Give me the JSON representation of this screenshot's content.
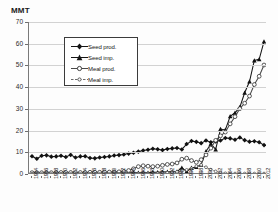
{
  "chart_data": {
    "type": "line",
    "title": "",
    "ylabel": "MMT",
    "xlabel": "",
    "ylim": [
      0,
      70
    ],
    "yticks": [
      0,
      10,
      20,
      30,
      40,
      50,
      60,
      70
    ],
    "grid": true,
    "legend_position": "upper-left-inside",
    "x": [
      1964,
      1965,
      1966,
      1967,
      1968,
      1969,
      1970,
      1971,
      1972,
      1973,
      1974,
      1975,
      1976,
      1977,
      1978,
      1979,
      1980,
      1981,
      1982,
      1983,
      1984,
      1985,
      1986,
      1987,
      1988,
      1989,
      1990,
      1991,
      1992,
      1993,
      1994,
      1995,
      1996,
      1997,
      1998,
      1999,
      2000,
      2001,
      2002,
      2003,
      2004,
      2005,
      2006,
      2007,
      2008,
      2009,
      2010,
      2011,
      2012
    ],
    "xtick_labels": [
      "1964",
      "1966",
      "1968",
      "1970",
      "1972",
      "1974",
      "1976",
      "1978",
      "1980",
      "1982",
      "1984",
      "1986",
      "1988",
      "1990",
      "1992",
      "1994",
      "1996",
      "1998",
      "2000",
      "2002",
      "2004",
      "2006",
      "2008",
      "2010",
      "2012"
    ],
    "series": [
      {
        "name": "Seed prod.",
        "marker": "filled-diamond",
        "line": "solid",
        "color": "#151515",
        "values": [
          8.2,
          7.0,
          8.4,
          8.6,
          8.0,
          8.1,
          8.4,
          7.8,
          8.8,
          7.6,
          8.1,
          8.2,
          7.4,
          7.2,
          7.6,
          7.8,
          8.1,
          8.5,
          8.7,
          9.0,
          9.4,
          9.8,
          10.3,
          10.8,
          11.2,
          11.6,
          11.4,
          11.0,
          11.5,
          11.8,
          12.0,
          11.3,
          13.8,
          15.2,
          14.8,
          14.2,
          15.4,
          14.6,
          15.0,
          15.4,
          16.6,
          16.4,
          15.8,
          16.8,
          15.6,
          14.9,
          15.1,
          14.6,
          13.3
        ]
      },
      {
        "name": "Seed imp.",
        "marker": "filled-triangle",
        "line": "solid",
        "color": "#151515",
        "values": [
          0.4,
          0.4,
          0.4,
          0.4,
          0.4,
          0.4,
          0.4,
          0.4,
          0.5,
          0.5,
          0.5,
          0.5,
          0.5,
          0.5,
          0.5,
          0.5,
          0.5,
          0.5,
          0.5,
          0.5,
          0.6,
          0.6,
          0.6,
          0.6,
          0.6,
          0.8,
          0.8,
          0.9,
          1.0,
          1.0,
          1.1,
          2.9,
          1.1,
          2.8,
          3.2,
          4.3,
          10.4,
          13.9,
          11.3,
          20.7,
          20.3,
          26.6,
          28.2,
          30.8,
          37.4,
          42.6,
          52.3,
          52.8,
          61.0
        ]
      },
      {
        "name": "Meal prod.",
        "marker": "open-circle",
        "line": "solid",
        "color": "#4a4a4a",
        "values": [
          0.6,
          0.6,
          0.6,
          0.6,
          0.6,
          0.7,
          0.7,
          0.7,
          0.7,
          0.7,
          0.7,
          0.7,
          0.8,
          0.8,
          0.8,
          0.9,
          0.9,
          1.0,
          1.0,
          1.2,
          1.6,
          2.4,
          3.4,
          3.8,
          3.6,
          3.4,
          3.6,
          4.0,
          4.4,
          4.6,
          5.1,
          6.8,
          7.3,
          6.2,
          5.4,
          6.6,
          8.8,
          11.9,
          15.5,
          17.6,
          19.3,
          23.1,
          26.4,
          30.1,
          32.6,
          35.9,
          41.2,
          45.0,
          50.2
        ]
      },
      {
        "name": "Meal imp.",
        "marker": "open-circle-small",
        "line": "dashed",
        "color": "#6a6a6a",
        "values": [
          0.1,
          0.1,
          0.1,
          0.1,
          0.1,
          0.1,
          0.1,
          0.1,
          0.1,
          0.1,
          0.1,
          0.1,
          0.1,
          0.1,
          0.1,
          0.1,
          0.1,
          0.1,
          0.1,
          0.1,
          0.1,
          0.1,
          0.2,
          0.2,
          0.2,
          0.2,
          0.3,
          0.4,
          0.6,
          0.8,
          1.0,
          1.4,
          1.9,
          2.6,
          3.6,
          4.2,
          3.1,
          2.0,
          1.2,
          0.6,
          0.3,
          0.2,
          0.2,
          0.2,
          0.2,
          0.2,
          0.2,
          0.2,
          0.2
        ]
      }
    ]
  },
  "legend": {
    "items": [
      {
        "label": "Seed prod."
      },
      {
        "label": "Seed imp."
      },
      {
        "label": "Meal prod."
      },
      {
        "label": "Meal imp."
      }
    ]
  },
  "axis": {
    "y_title": "MMT",
    "y_labels": [
      "70",
      "60",
      "50",
      "40",
      "30",
      "20",
      "10",
      "0"
    ]
  }
}
